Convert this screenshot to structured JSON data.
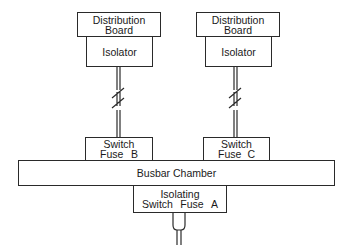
{
  "diagram": {
    "left_branch": {
      "distribution_board": {
        "line1": "Distribution",
        "line2": "Board"
      },
      "isolator": {
        "label": "Isolator"
      },
      "switch_fuse": {
        "line1": "Switch",
        "word": "Fuse",
        "letter": "B"
      }
    },
    "right_branch": {
      "distribution_board": {
        "line1": "Distribution",
        "line2": "Board"
      },
      "isolator": {
        "label": "Isolator"
      },
      "switch_fuse": {
        "line1": "Switch",
        "word": "Fuse",
        "letter": "C"
      }
    },
    "busbar": {
      "label": "Busbar Chamber"
    },
    "main_switch": {
      "line1": "Isolating",
      "word1": "Switch",
      "word2": "Fuse",
      "letter": "A"
    }
  }
}
